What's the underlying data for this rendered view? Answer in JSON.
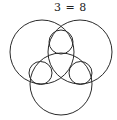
{
  "equation": {
    "text": "3 = 8"
  },
  "diagram": {
    "stroke_color": "#2a2a2a",
    "background": "#ffffff",
    "large_circles": [
      {
        "name": "left",
        "cx": 42,
        "cy": 52,
        "r": 32
      },
      {
        "name": "right",
        "cx": 80,
        "cy": 52,
        "r": 32
      },
      {
        "name": "bottom",
        "cx": 61,
        "cy": 84,
        "r": 31
      }
    ],
    "small_circles": [
      {
        "name": "top",
        "cx": 61,
        "cy": 42,
        "r": 12
      },
      {
        "name": "left",
        "cx": 40.5,
        "cy": 73,
        "r": 11.5
      },
      {
        "name": "right",
        "cx": 80.5,
        "cy": 73,
        "r": 11.5
      }
    ]
  }
}
